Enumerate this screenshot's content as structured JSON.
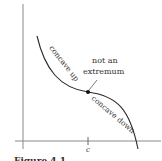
{
  "figure": {
    "labels": {
      "concave_up": "concave up",
      "concave_down": "concave down",
      "annotation_line1": "not an",
      "annotation_line2": "extremum",
      "x_tick": "c"
    },
    "caption_partial": "Figure 4.1",
    "colors": {
      "axis": "#8a8a8a",
      "curve": "#2a2a2a",
      "point": "#111111",
      "text": "#333333"
    }
  }
}
